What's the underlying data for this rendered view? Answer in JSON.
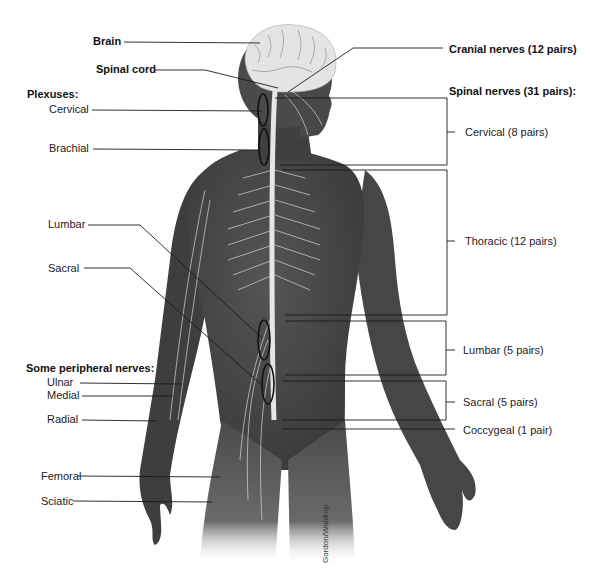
{
  "figure": {
    "credit": "Gordon/Waldrop",
    "colors": {
      "body": "#4a4a4a",
      "body_dark": "#2e2e2e",
      "nerve": "#e8e8e8",
      "brain": "#e6e6e6",
      "leader": "#1a1a1a",
      "background": "#ffffff"
    }
  },
  "labels_left": {
    "brain": "Brain",
    "spinal_cord": "Spinal cord",
    "plexuses_heading": "Plexuses:",
    "plexuses": {
      "cervical": "Cervical",
      "brachial": "Brachial",
      "lumbar": "Lumbar",
      "sacral": "Sacral"
    },
    "peripheral_heading": "Some peripheral nerves:",
    "peripheral": {
      "ulnar": "Ulnar",
      "medial": "Medial",
      "radial": "Radial",
      "femoral": "Femoral",
      "sciatic": "Sciatic"
    }
  },
  "labels_right": {
    "cranial_nerves": "Cranial nerves (12 pairs)",
    "spinal_nerves_heading": "Spinal nerves (31 pairs):",
    "spinal_groups": {
      "cervical": "Cervical (8 pairs)",
      "thoracic": "Thoracic (12 pairs)",
      "lumbar": "Lumbar (5 pairs)",
      "sacral": "Sacral (5 pairs)",
      "coccygeal": "Coccygeal (1 pair)"
    }
  }
}
